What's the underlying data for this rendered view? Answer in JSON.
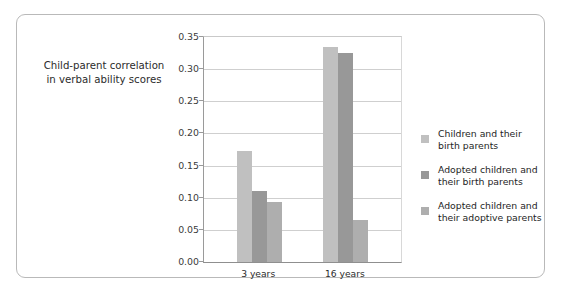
{
  "chart_data": {
    "type": "bar",
    "title": "",
    "subtitle": "",
    "xlabel": "",
    "ylabel": "Child-parent correlation in verbal ability scores",
    "ylabel_lines": [
      "Child-parent correlation",
      "in verbal ability scores"
    ],
    "categories": [
      "3 years",
      "16 years"
    ],
    "series": [
      {
        "name": "Children and their birth parents",
        "name_lines": [
          "Children and their",
          "birth parents"
        ],
        "color": "#c0c0c0",
        "values": [
          0.172,
          0.335
        ]
      },
      {
        "name": "Adopted children and their birth parents",
        "name_lines": [
          "Adopted children and",
          "their birth parents"
        ],
        "color": "#989898",
        "values": [
          0.11,
          0.325
        ]
      },
      {
        "name": "Adopted children and their adoptive parents",
        "name_lines": [
          "Adopted children and",
          "their adoptive parents"
        ],
        "color": "#aeaeae",
        "values": [
          0.094,
          0.066
        ]
      }
    ],
    "ylim": [
      0.0,
      0.35
    ],
    "yticks": [
      "0.00",
      "0.05",
      "0.10",
      "0.15",
      "0.20",
      "0.25",
      "0.30",
      "0.35"
    ],
    "ytick_values": [
      0.0,
      0.05,
      0.1,
      0.15,
      0.2,
      0.25,
      0.3,
      0.35
    ],
    "grid": true,
    "legend_position": "right",
    "annotations": []
  },
  "figure": {
    "border_color": "#b9b9b9",
    "background": "#ffffff"
  }
}
